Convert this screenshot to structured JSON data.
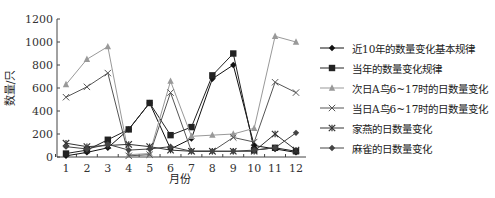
{
  "chart_data": {
    "type": "line",
    "title": "",
    "xlabel": "月份",
    "ylabel": "数量/只",
    "ylim": [
      0,
      1200
    ],
    "yticks": [
      0,
      200,
      400,
      600,
      800,
      1000,
      1200
    ],
    "x": [
      1,
      2,
      3,
      4,
      5,
      6,
      7,
      8,
      9,
      10,
      11,
      12
    ],
    "grid": false,
    "legend_position": "right",
    "series": [
      {
        "name": "近10年的数量变化基本规律",
        "marker": "diamond",
        "color": "#111111",
        "values": [
          10,
          40,
          80,
          240,
          470,
          70,
          160,
          680,
          800,
          100,
          70,
          40
        ]
      },
      {
        "name": "当年的数量变化规律",
        "marker": "square",
        "color": "#222222",
        "values": [
          30,
          60,
          150,
          240,
          470,
          190,
          260,
          710,
          900,
          60,
          80,
          50
        ]
      },
      {
        "name": "次日A鸟6~17时的日数量变化",
        "marker": "triangle",
        "color": "#999999",
        "values": [
          630,
          850,
          960,
          20,
          30,
          660,
          180,
          190,
          200,
          250,
          1050,
          1000
        ]
      },
      {
        "name": "当日A鸟6~17时的日数量变化",
        "marker": "x",
        "color": "#555555",
        "values": [
          520,
          610,
          730,
          10,
          20,
          560,
          50,
          50,
          170,
          130,
          650,
          560
        ]
      },
      {
        "name": "家燕的日数量变化",
        "marker": "star",
        "color": "#333333",
        "values": [
          120,
          90,
          100,
          110,
          90,
          60,
          50,
          50,
          50,
          50,
          200,
          60
        ]
      },
      {
        "name": "麻雀的日数量变化",
        "marker": "diamond",
        "color": "#444444",
        "values": [
          90,
          70,
          110,
          60,
          70,
          90,
          50,
          50,
          50,
          60,
          80,
          210
        ]
      }
    ]
  }
}
